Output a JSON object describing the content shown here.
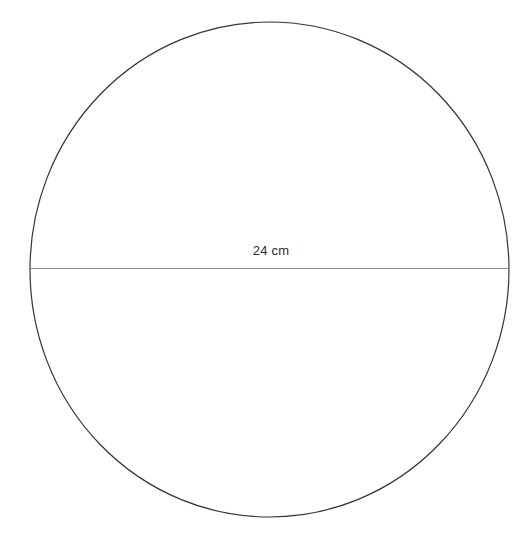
{
  "figure": {
    "kind": "geometry-diagram",
    "background_color": "#ffffff",
    "shape": {
      "name": "circle",
      "stroke_color": "#333333",
      "stroke_width": 1.2,
      "fill": "none",
      "center_x": 269.5,
      "center_y": 269.5,
      "radius_x": 239.5,
      "radius_y": 247.5
    },
    "diameter_line": {
      "name": "diameter",
      "stroke_color": "#8c8c8c",
      "stroke_width": 1.1,
      "x1": 30,
      "y1": 268,
      "x2": 509,
      "y2": 268
    },
    "labels": {
      "diameter_measure": "24 cm"
    }
  },
  "chart_data": {
    "type": "diagram",
    "title": "",
    "shapes": [
      {
        "type": "circle",
        "center": [
          269.5,
          269.5
        ],
        "radius_x": 239.5,
        "radius_y": 247.5,
        "stroke": "#333333",
        "fill": "none"
      },
      {
        "type": "line",
        "role": "diameter",
        "from": [
          30,
          268
        ],
        "to": [
          509,
          268
        ],
        "stroke": "#8c8c8c"
      }
    ],
    "annotations": [
      {
        "text": "24 cm",
        "x": 279,
        "y": 259,
        "role": "diameter-measurement",
        "value": 24,
        "unit": "cm"
      }
    ]
  }
}
